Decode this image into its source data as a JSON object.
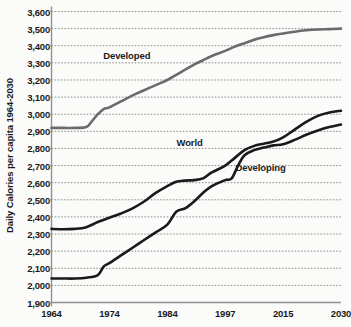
{
  "chart_data": {
    "type": "line",
    "title": "",
    "xlabel": "",
    "ylabel": "Daily Calories per capita 1964-2030",
    "categories": [
      "1964",
      "1974",
      "1984",
      "1997",
      "2015",
      "2030"
    ],
    "xlim": [
      1964,
      2030
    ],
    "ylim": [
      1900,
      3600
    ],
    "ytick_step": 100,
    "yticks": [
      3600,
      3500,
      3400,
      3300,
      3200,
      3100,
      3000,
      2900,
      2800,
      2700,
      2600,
      2500,
      2400,
      2300,
      2200,
      2100,
      2000,
      1900
    ],
    "ytick_labels": [
      "3,600",
      "3,500",
      "3,400",
      "3,300",
      "3,200",
      "3,100",
      "3,000",
      "2,900",
      "2,800",
      "2,700",
      "2,600",
      "2,500",
      "2,400",
      "2,300",
      "2,200",
      "2,100",
      "2,000",
      "1,900"
    ],
    "grid": true,
    "grid_style": "dotted",
    "legend_position": "inline-annotations",
    "series": [
      {
        "name": "Developed",
        "color": "#6b6b6b",
        "label_x": 1977,
        "label_y": 3345,
        "x": [
          1964,
          1966,
          1968,
          1970,
          1971,
          1972,
          1973,
          1974,
          1976,
          1978,
          1980,
          1982,
          1984,
          1986,
          1988,
          1990,
          1992,
          1994,
          1997,
          2000,
          2003,
          2006,
          2009,
          2012,
          2015,
          2018,
          2021,
          2024,
          2027,
          2030
        ],
        "y": [
          2920,
          2920,
          2920,
          2925,
          2960,
          3000,
          3030,
          3040,
          3075,
          3110,
          3140,
          3170,
          3200,
          3230,
          3260,
          3290,
          3315,
          3340,
          3370,
          3395,
          3415,
          3435,
          3450,
          3462,
          3472,
          3482,
          3490,
          3495,
          3497,
          3500
        ]
      },
      {
        "name": "World",
        "color": "#1a1a1a",
        "label_x": 1989,
        "label_y": 2840,
        "x": [
          1964,
          1966,
          1968,
          1970,
          1972,
          1974,
          1976,
          1978,
          1980,
          1982,
          1984,
          1986,
          1988,
          1990,
          1992,
          1994,
          1997,
          2000,
          2003,
          2006,
          2009,
          2012,
          2015,
          2018,
          2021,
          2024,
          2027,
          2030
        ],
        "y": [
          2330,
          2328,
          2330,
          2340,
          2370,
          2395,
          2420,
          2450,
          2490,
          2540,
          2580,
          2605,
          2612,
          2615,
          2625,
          2660,
          2700,
          2745,
          2790,
          2815,
          2828,
          2840,
          2865,
          2910,
          2955,
          2990,
          3010,
          3020
        ]
      },
      {
        "name": "Developing",
        "color": "#1a1a1a",
        "label_x": 2008,
        "label_y": 2690,
        "x": [
          1964,
          1966,
          1968,
          1970,
          1972,
          1973,
          1974,
          1976,
          1978,
          1980,
          1982,
          1984,
          1986,
          1988,
          1990,
          1992,
          1994,
          1997,
          1999,
          2001,
          2003,
          2006,
          2009,
          2012,
          2015,
          2018,
          2021,
          2024,
          2027,
          2030
        ],
        "y": [
          2040,
          2040,
          2040,
          2045,
          2060,
          2110,
          2130,
          2175,
          2220,
          2265,
          2310,
          2355,
          2430,
          2450,
          2490,
          2540,
          2580,
          2615,
          2625,
          2700,
          2760,
          2790,
          2805,
          2818,
          2825,
          2850,
          2880,
          2905,
          2925,
          2940
        ]
      }
    ]
  }
}
